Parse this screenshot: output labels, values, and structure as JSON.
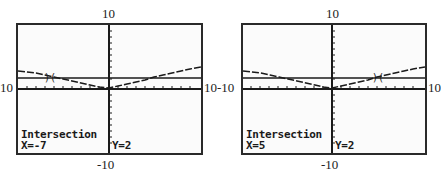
{
  "panels": [
    {
      "window": {
        "ymax": "10",
        "ymin": "-10",
        "xmin": "10",
        "xmax": "10"
      },
      "status": {
        "title": "Intersection",
        "x_readout": "X=-7",
        "y_readout": "Y=2"
      },
      "cursor_x": -7
    },
    {
      "window": {
        "ymax": "10",
        "ymin": "-10",
        "xmin": "-10",
        "xmax": "10"
      },
      "status": {
        "title": "Intersection",
        "x_readout": "X=5",
        "y_readout": "Y=2"
      },
      "cursor_x": 5
    }
  ],
  "colors": {
    "frame": "#2a2a2a",
    "screen_bg": "#fbfbfb",
    "ink": "#1a1a1a"
  }
}
